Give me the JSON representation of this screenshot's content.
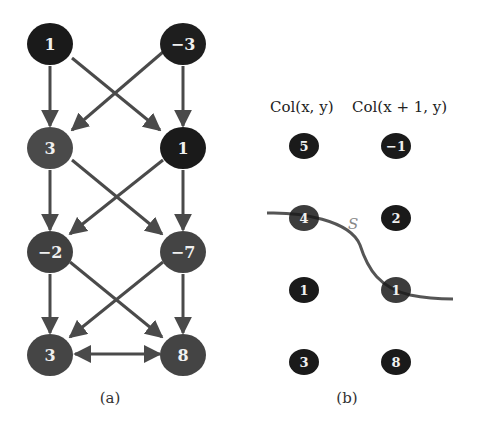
{
  "panel_a": {
    "caption": "(a)",
    "nodes": [
      {
        "id": "a00",
        "label": "1",
        "color": "#1a1a1a"
      },
      {
        "id": "a01",
        "label": "−3",
        "color": "#1e1e1e"
      },
      {
        "id": "a10",
        "label": "3",
        "color": "#4a4a4a"
      },
      {
        "id": "a11",
        "label": "1",
        "color": "#1a1a1a"
      },
      {
        "id": "a20",
        "label": "−2",
        "color": "#404040"
      },
      {
        "id": "a21",
        "label": "−7",
        "color": "#444444"
      },
      {
        "id": "a30",
        "label": "3",
        "color": "#454545"
      },
      {
        "id": "a31",
        "label": "8",
        "color": "#444444"
      }
    ],
    "edge_color": "#4a4a4a"
  },
  "panel_b": {
    "caption": "(b)",
    "header_left": "Col(x, y)",
    "header_right": "Col(x + 1, y)",
    "curve_label": "S",
    "nodes": [
      {
        "id": "b00",
        "label": "5"
      },
      {
        "id": "b01",
        "label": "−1"
      },
      {
        "id": "b10",
        "label": "4"
      },
      {
        "id": "b11",
        "label": "2"
      },
      {
        "id": "b20",
        "label": "1"
      },
      {
        "id": "b21",
        "label": "1"
      },
      {
        "id": "b30",
        "label": "3"
      },
      {
        "id": "b31",
        "label": "8"
      }
    ],
    "node_color": "#1a1a1a",
    "curve_color": "#555555"
  }
}
